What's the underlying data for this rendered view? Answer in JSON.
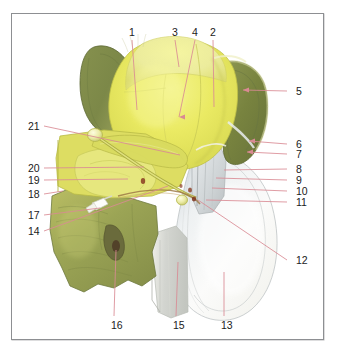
{
  "figure": {
    "caption": "",
    "frame_color": "#8d8f92",
    "background_color": "#ffffff",
    "leader_line_color": "#d98a93",
    "palette": {
      "bright_yellow": "#e9e95e",
      "pale_yellow": "#f0f09a",
      "mid_olive": "#c9cc63",
      "dark_olive": "#7f8a4a",
      "deep_olive": "#6d7a3f",
      "pale_grey_white": "#f2f2f0",
      "grey_shadow": "#c9cbc6",
      "bluish_white": "#e6eaec",
      "instrument_white": "#fdfdfb",
      "dark_red_accent": "#8a3b22"
    }
  },
  "labels": [
    {
      "id": "1",
      "text": "1",
      "x": 129,
      "y": 27,
      "align": "left",
      "tip_x": 137,
      "tip_y": 110
    },
    {
      "id": "3",
      "text": "3",
      "x": 172,
      "y": 27,
      "align": "left",
      "tip_x": 179,
      "tip_y": 67
    },
    {
      "id": "4",
      "text": "4",
      "x": 192,
      "y": 27,
      "align": "left",
      "tip_x": 179,
      "tip_y": 117
    },
    {
      "id": "2",
      "text": "2",
      "x": 210,
      "y": 27,
      "align": "left",
      "tip_x": 214,
      "tip_y": 107
    },
    {
      "id": "5",
      "text": "5",
      "x": 296,
      "y": 86,
      "align": "left",
      "tip_x": 243,
      "tip_y": 90
    },
    {
      "id": "6",
      "text": "6",
      "x": 296,
      "y": 139,
      "align": "left",
      "tip_x": 249,
      "tip_y": 141
    },
    {
      "id": "7",
      "text": "7",
      "x": 296,
      "y": 149,
      "align": "left",
      "tip_x": 247,
      "tip_y": 152
    },
    {
      "id": "8",
      "text": "8",
      "x": 296,
      "y": 164,
      "align": "left",
      "tip_x": 224,
      "tip_y": 170
    },
    {
      "id": "9",
      "text": "9",
      "x": 296,
      "y": 175,
      "align": "left",
      "tip_x": 216,
      "tip_y": 178
    },
    {
      "id": "10",
      "text": "10",
      "x": 296,
      "y": 186,
      "align": "left",
      "tip_x": 212,
      "tip_y": 188
    },
    {
      "id": "11",
      "text": "11",
      "x": 296,
      "y": 197,
      "align": "left",
      "tip_x": 206,
      "tip_y": 200
    },
    {
      "id": "12",
      "text": "12",
      "x": 296,
      "y": 255,
      "align": "left",
      "tip_x": 198,
      "tip_y": 200
    },
    {
      "id": "21",
      "text": "21",
      "x": 28,
      "y": 121,
      "align": "left",
      "tip_x": 180,
      "tip_y": 155
    },
    {
      "id": "20",
      "text": "20",
      "x": 28,
      "y": 163,
      "align": "left",
      "tip_x": 144,
      "tip_y": 167
    },
    {
      "id": "19",
      "text": "19",
      "x": 28,
      "y": 175,
      "align": "left",
      "tip_x": 128,
      "tip_y": 179
    },
    {
      "id": "18",
      "text": "18",
      "x": 28,
      "y": 189,
      "align": "left",
      "tip_x": 63,
      "tip_y": 191
    },
    {
      "id": "17",
      "text": "17",
      "x": 28,
      "y": 210,
      "align": "left",
      "tip_x": 100,
      "tip_y": 208
    },
    {
      "id": "14",
      "text": "14",
      "x": 28,
      "y": 226,
      "align": "left",
      "tip_x": 168,
      "tip_y": 186
    },
    {
      "id": "16",
      "text": "16",
      "x": 111,
      "y": 320,
      "align": "left",
      "tip_x": 116,
      "tip_y": 250
    },
    {
      "id": "15",
      "text": "15",
      "x": 173,
      "y": 320,
      "align": "left",
      "tip_x": 178,
      "tip_y": 262
    },
    {
      "id": "13",
      "text": "13",
      "x": 221,
      "y": 320,
      "align": "left",
      "tip_x": 224,
      "tip_y": 272
    }
  ],
  "arrow_markers": [
    {
      "name": "arrow-to-5",
      "x": 243,
      "y": 90
    },
    {
      "name": "arrow-to-6",
      "x": 249,
      "y": 141
    },
    {
      "name": "arrow-to-7",
      "x": 247,
      "y": 152
    },
    {
      "name": "arrow-to-4",
      "x": 179,
      "y": 117
    }
  ]
}
